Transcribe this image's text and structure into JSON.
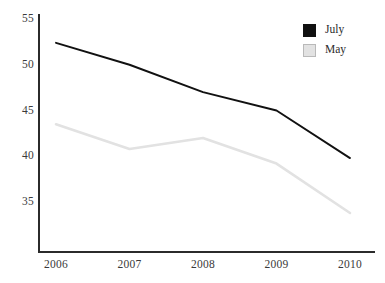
{
  "chart_data": {
    "type": "line",
    "title": "",
    "subtitle": "",
    "xlabel": "",
    "ylabel": "",
    "categories": [
      "2006",
      "2007",
      "2008",
      "2009",
      "2010"
    ],
    "x": [
      2006,
      2007,
      2008,
      2009,
      2010
    ],
    "series": [
      {
        "name": "July",
        "color": "#111111",
        "values": [
          52.4,
          50.0,
          47.0,
          45.0,
          39.8
        ]
      },
      {
        "name": "May",
        "color": "#e2e2e2",
        "values": [
          43.5,
          40.8,
          42.0,
          39.2,
          33.8
        ]
      }
    ],
    "ylim": [
      30.5,
      55.5
    ],
    "yticks": [
      35,
      40,
      45,
      50,
      55
    ],
    "ytick_labels": [
      "35",
      "40",
      "45",
      "50",
      "55"
    ],
    "xlim": [
      2005.7,
      2010.35
    ],
    "grid": false,
    "legend_position": "top-right",
    "legend": [
      {
        "label": "July",
        "swatch": "black-square-icon",
        "color": "#111111"
      },
      {
        "label": "May",
        "swatch": "gray-square-icon",
        "color": "#e2e2e2"
      }
    ],
    "annotations": []
  },
  "axes": {
    "y_ticks": [
      "55",
      "50",
      "45",
      "40",
      "35"
    ],
    "x_ticks": [
      "2006",
      "2007",
      "2008",
      "2009",
      "2010"
    ]
  },
  "colors": {
    "axis": "#2b2b2b",
    "july_line": "#111111",
    "may_line": "#e2e2e2",
    "tick_text": "#3a3a3a",
    "background": "#ffffff"
  }
}
